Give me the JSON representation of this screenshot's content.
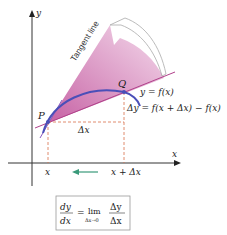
{
  "axes": {
    "x_label": "x",
    "y_label": "y"
  },
  "points": {
    "p_label": "P",
    "q_label": "Q"
  },
  "curve_label": "y = f(x)",
  "tangent_label": "Tangent line",
  "delta_y_label": "Δy = f(x + Δx) − f(x)",
  "delta_x_label": "Δx",
  "x_tick_labels": [
    "x",
    "x + Δx"
  ],
  "formula": {
    "lhs_num": "dy",
    "lhs_den": "dx",
    "equals": "=",
    "lim": "lim",
    "lim_sub": "Δx→0",
    "rhs_num": "Δy",
    "rhs_den": "Δx"
  },
  "colors": {
    "curve": "#4a4fb8",
    "secant": "#b0408a",
    "fill": "#d98cc0",
    "dashed": "#d8704a",
    "arrow": "#3a9a7a",
    "axis": "#333333"
  }
}
